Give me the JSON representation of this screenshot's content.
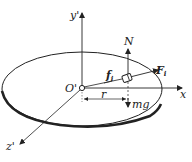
{
  "diagram": {
    "type": "physics-free-body-rotating-disk",
    "labels": {
      "y_axis": "y'",
      "x_axis": "x",
      "z_axis": "z'",
      "origin": "O'",
      "normal_force": "N",
      "friction": "f",
      "friction_sub": "i",
      "inertial_force": "F",
      "inertial_sub": "i",
      "radius": "r",
      "weight": "mg"
    },
    "colors": {
      "stroke": "#222222",
      "background": "#ffffff"
    }
  }
}
